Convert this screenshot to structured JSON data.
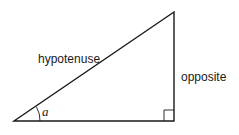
{
  "diagram": {
    "type": "right-triangle",
    "labels": {
      "hypotenuse": "hypotenuse",
      "opposite": "opposite",
      "angle": "a"
    },
    "vertices": {
      "bottom_left": [
        14,
        121
      ],
      "bottom_right": [
        174,
        121
      ],
      "top": [
        174,
        12
      ]
    },
    "colors": {
      "stroke": "#1a1a1a",
      "background": "#ffffff"
    }
  }
}
